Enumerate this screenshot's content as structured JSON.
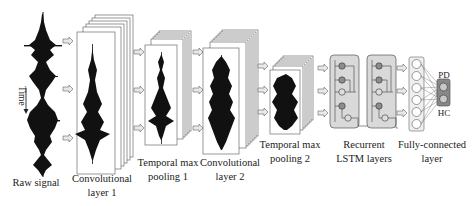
{
  "diagram": {
    "stages": [
      {
        "id": "raw",
        "label_line1": "Raw signal",
        "label_line2": ""
      },
      {
        "id": "conv1",
        "label_line1": "Convolutional",
        "label_line2": "layer 1"
      },
      {
        "id": "pool1",
        "label_line1": "Temporal max",
        "label_line2": "pooling 1"
      },
      {
        "id": "conv2",
        "label_line1": "Convolutional",
        "label_line2": "layer 2"
      },
      {
        "id": "pool2",
        "label_line1": "Temporal max",
        "label_line2": "pooling 2"
      },
      {
        "id": "lstm",
        "label_line1": "Recurrent",
        "label_line2": "LSTM layers"
      },
      {
        "id": "fc",
        "label_line1": "Fully-connected",
        "label_line2": "layer"
      }
    ],
    "time_axis_label": "Time",
    "outputs": [
      "PD",
      "HC"
    ],
    "colors": {
      "signal": "#111111",
      "frame_stroke": "#555555",
      "lstm_fill": "#d9d9d9",
      "node_fill": "#8c8c8c",
      "arrow_fill": "#e6e6e6"
    }
  }
}
